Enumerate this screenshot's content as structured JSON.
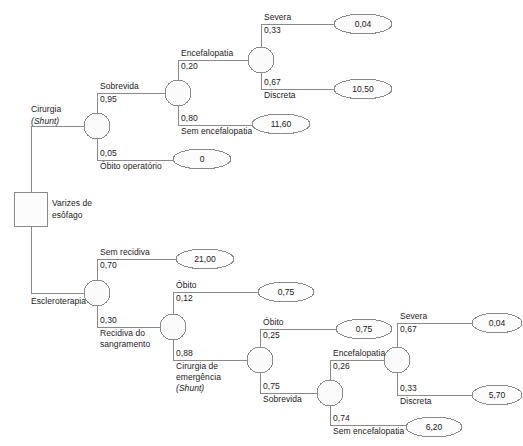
{
  "diagram": {
    "type": "decision-tree",
    "title": "",
    "root": {
      "name": "Varizes de esôfago",
      "shape": "square",
      "label_lines": [
        "Varizes de",
        "esôfago"
      ]
    },
    "colors": {
      "line": "#8a8a8a",
      "node_fill": "#fbfbfb",
      "node_stroke": "#8a8a8a",
      "text": "#1a1a1a",
      "background": "#ffffff"
    },
    "branch_labels": {
      "cirurgia": "Cirurgia",
      "cirurgia_sub": "(Shunt)",
      "escleroterapia": "Escleroterapia",
      "sobrevida": "Sobrevida",
      "obito_operatorio": "Óbito operatório",
      "encefalopatia": "Encefalopatia",
      "sem_encefalopatia": "Sem encefalopatia",
      "severa": "Severa",
      "discreta": "Discreta",
      "sem_recidiva": "Sem recidiva",
      "recidiva_l1": "Recidiva do",
      "recidiva_l2": "sangramento",
      "obito": "Óbito",
      "cirurgia_emerg_l1": "Cirurgia de",
      "cirurgia_emerg_l2": "emergência",
      "cirurgia_emerg_l3": "(Shunt)",
      "obito2": "Óbito",
      "sobrevida2": "Sobrevida",
      "encefalopatia2": "Encefalopatia",
      "sem_encefalopatia2": "Sem encefalopatia",
      "severa2": "Severa",
      "discreta2": "Discreta"
    },
    "probabilities": {
      "p_sobrevida": "0,95",
      "p_obito_operatorio": "0,05",
      "p_encefalopatia": "0,20",
      "p_sem_encefalopatia": "0,80",
      "p_severa": "0,33",
      "p_discreta": "0,67",
      "p_sem_recidiva": "0,70",
      "p_recidiva": "0,30",
      "p_obito": "0,12",
      "p_cirurgia_emerg": "0,88",
      "p_obito2": "0,25",
      "p_sobrevida2": "0,75",
      "p_encefalopatia2": "0,26",
      "p_sem_encefalopatia2": "0,74",
      "p_severa2": "0,67",
      "p_discreta2": "0,33"
    },
    "payoffs": {
      "severa_top": "0,04",
      "discreta_top": "10,50",
      "sem_encefalopatia_top": "11,60",
      "obito_operatorio": "0",
      "sem_recidiva": "21,00",
      "obito": "0,75",
      "obito2": "0,75",
      "severa_bottom": "0,04",
      "discreta_bottom": "5,70",
      "sem_encefalopatia_bottom": "6,20"
    }
  }
}
